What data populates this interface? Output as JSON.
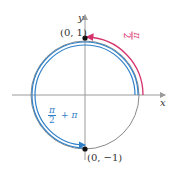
{
  "diagram": {
    "title": "",
    "axes": {
      "x_label": "x",
      "y_label": "y"
    },
    "points": [
      {
        "label": "(0, 1)",
        "x": 0,
        "y": 1
      },
      {
        "label": "(0, −1)",
        "x": 0,
        "y": -1
      }
    ],
    "arcs": [
      {
        "name": "pi-over-2-arc",
        "from": "(1, 0)",
        "to": "(0, 1)",
        "color": "#d6336c",
        "label_num": "π",
        "label_den": "2",
        "label_suffix": ""
      },
      {
        "name": "pi-over-2-plus-pi-arc",
        "from": "(1, 0)",
        "to": "(0, −1)",
        "color": "#2f80c8",
        "label_num": "π",
        "label_den": "2",
        "label_suffix": "+ π"
      }
    ],
    "colors": {
      "circle": "#8a8a8a",
      "axis": "#9a9a9a",
      "pink": "#d6336c",
      "blue": "#2f80c8",
      "point": "#111111"
    }
  }
}
